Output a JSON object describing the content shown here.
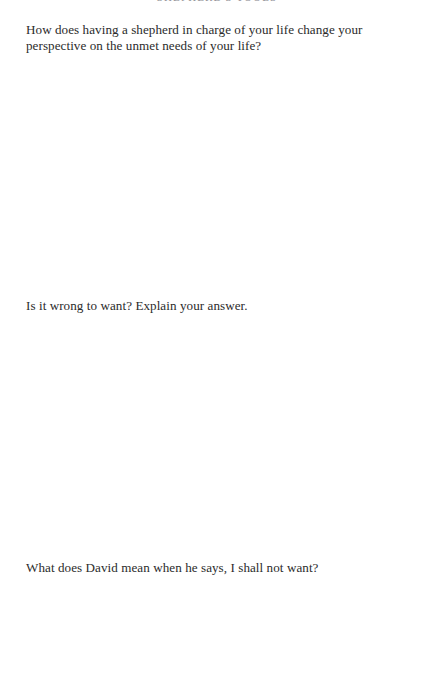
{
  "page": {
    "running_head": "SHEPHERD'S TOOLS",
    "background_color": "#ffffff",
    "text_color": "#2b2b2b"
  },
  "questions": [
    {
      "id": "q1",
      "text": "How does having a shepherd in charge of your life change your perspective on the unmet needs of your life?"
    },
    {
      "id": "q2",
      "text": "Is it wrong to want? Explain your answer."
    },
    {
      "id": "q3",
      "text": "What does David mean when he says, I shall not want?"
    }
  ]
}
